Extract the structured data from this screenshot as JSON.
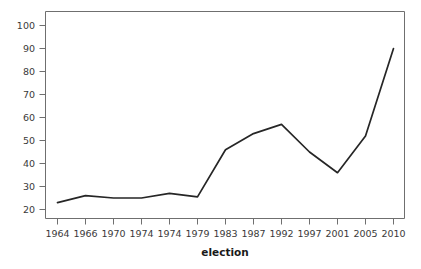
{
  "chart_data": {
    "type": "line",
    "title": "",
    "subtitle": "",
    "xlabel": "election",
    "ylabel": "",
    "categories": [
      "1964",
      "1966",
      "1970",
      "1974",
      "1974",
      "1979",
      "1983",
      "1987",
      "1992",
      "1997",
      "2001",
      "2005",
      "2010"
    ],
    "values": [
      23,
      26,
      25,
      25,
      27,
      25.5,
      46,
      53,
      57,
      45,
      36,
      52,
      90
    ],
    "series": [
      {
        "name": "election",
        "values": [
          23,
          26,
          25,
          25,
          27,
          25.5,
          46,
          53,
          57,
          45,
          36,
          52,
          90
        ]
      }
    ],
    "ylim": [
      16,
      104
    ],
    "yticks": [
      20,
      30,
      40,
      50,
      60,
      70,
      80,
      90,
      100
    ],
    "ytick_labels": [
      "20",
      "30",
      "40",
      "50",
      "60",
      "70",
      "80",
      "90",
      "100"
    ],
    "xtick_labels": [
      "1964",
      "1966",
      "1970",
      "1974",
      "1974",
      "1979",
      "1983",
      "1987",
      "1992",
      "1997",
      "2001",
      "2005",
      "2010"
    ],
    "grid": false,
    "legend": null,
    "legend_position": "none",
    "line_color": "#262626",
    "axis_color": "#6f6f6f",
    "background_color": "#ffffff"
  },
  "axis_titles": {
    "x": "election"
  }
}
